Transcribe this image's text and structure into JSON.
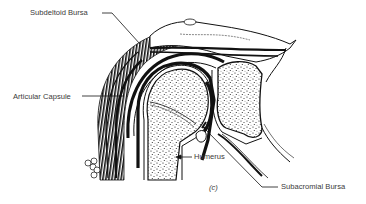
{
  "figure": {
    "panel_label": "(c)",
    "colors": {
      "ink": "#111111",
      "label_text": "#3a3a3a",
      "background": "#ffffff"
    }
  },
  "labels": [
    {
      "id": "subdeltoid-bursa",
      "text": "Subdeltoid Bursa",
      "x": 30,
      "y": 10
    },
    {
      "id": "articular-capsule",
      "text": "Articular Capsule",
      "x": 13,
      "y": 94
    },
    {
      "id": "humerus",
      "text": "Humerus",
      "x": 193,
      "y": 154
    },
    {
      "id": "subacromial-bursa",
      "text": "Subacromial Bursa",
      "x": 281,
      "y": 184
    }
  ]
}
